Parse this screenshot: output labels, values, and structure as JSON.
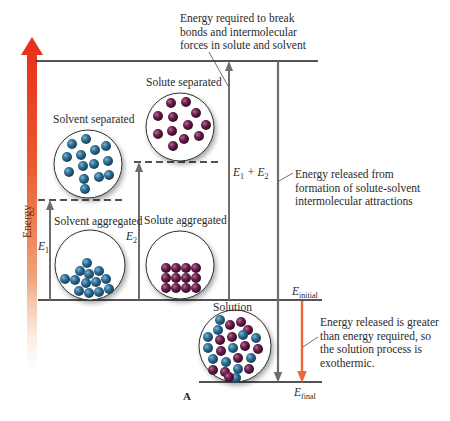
{
  "figure": {
    "panel_label": "A",
    "axis": {
      "label": "Energy",
      "arrow_color_top": "#e8321c",
      "arrow_color_bottom": "#f6c9a6"
    },
    "levels": {
      "top": "solute and solvent separated",
      "solvent_separated_dashed": "solvent separated",
      "solute_separated_dashed": "solute separated",
      "initial": {
        "symbol": "E",
        "subscript": "initial"
      },
      "final": {
        "symbol": "E",
        "subscript": "final"
      }
    },
    "states": [
      {
        "id": "solvent-separated",
        "label": "Solvent separated",
        "particle_color": "#2e6f93"
      },
      {
        "id": "solute-separated",
        "label": "Solute separated",
        "particle_color": "#6a1f4c"
      },
      {
        "id": "solvent-aggregated",
        "label": "Solvent aggregated",
        "particle_color": "#2e6f93"
      },
      {
        "id": "solute-aggregated",
        "label": "Solute aggregated",
        "particle_color": "#6a1f4c"
      },
      {
        "id": "solution",
        "label": "Solution",
        "particle_colors": [
          "#2e6f93",
          "#6a1f4c"
        ]
      }
    ],
    "arrows": {
      "e1": {
        "symbol": "E",
        "subscript": "1"
      },
      "e2": {
        "symbol": "E",
        "subscript": "2"
      },
      "e1e2": {
        "text": "E",
        "sub1": "1",
        "plus": " + E",
        "sub2": "2"
      }
    },
    "annotations": {
      "energy_required": [
        "Energy required to break",
        "bonds and intermolecular",
        "forces in solute and solvent"
      ],
      "energy_released": [
        "Energy released from",
        "formation of solute-solvent",
        "intermolecular attractions"
      ],
      "exothermic": [
        "Energy released is greater",
        "than energy required, so",
        "the solution process is",
        "exothermic."
      ]
    },
    "colors": {
      "line": "#1a1a1a",
      "grey_arrow": "#6e6e6e",
      "exothermic_arrow": "#e9693a",
      "solvent_particle": "#2e6f93",
      "solute_particle": "#6a1f4c"
    }
  }
}
